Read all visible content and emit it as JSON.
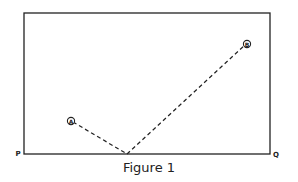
{
  "figure": {
    "caption": "Figure 1",
    "points": {
      "A": {
        "label": "A",
        "x": 73,
        "y": 122
      },
      "B": {
        "label": "B",
        "x": 246,
        "y": 44
      },
      "reflection": {
        "x": 127,
        "y": 154
      }
    },
    "corners": {
      "P": {
        "label": "P"
      },
      "Q": {
        "label": "Q"
      }
    },
    "colors": {
      "line": "#222222",
      "background": "#ffffff"
    }
  }
}
